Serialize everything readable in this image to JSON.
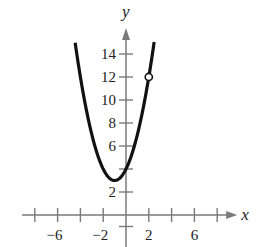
{
  "chart_data": {
    "type": "line",
    "title": "",
    "xlabel": "x",
    "ylabel": "y",
    "function": "y = x^2 + 2x + 4 (x < 2)",
    "xlim": [
      -8,
      8
    ],
    "ylim": [
      -1.5,
      15
    ],
    "x_ticks": [
      -8,
      -6,
      -4,
      -2,
      0,
      2,
      4,
      6,
      8
    ],
    "x_tick_labels": [
      {
        "value": -6,
        "label": "−6"
      },
      {
        "value": -2,
        "label": "−2"
      },
      {
        "value": 2,
        "label": "2"
      },
      {
        "value": 6,
        "label": "6"
      }
    ],
    "y_ticks": [
      -1,
      2,
      4,
      6,
      8,
      10,
      12,
      14
    ],
    "y_tick_labels": [
      {
        "value": 2,
        "label": "2"
      },
      {
        "value": 6,
        "label": "6"
      },
      {
        "value": 8,
        "label": "8"
      },
      {
        "value": 10,
        "label": "10"
      },
      {
        "value": 12,
        "label": "12"
      },
      {
        "value": 14,
        "label": "14"
      }
    ],
    "series": [
      {
        "name": "parabola",
        "vertex": [
          -1,
          3
        ],
        "y_intercept": [
          0,
          4
        ],
        "x_range": [
          -4.46,
          2
        ],
        "points": [
          [
            -4.46,
            15
          ],
          [
            -4,
            12
          ],
          [
            -3,
            7
          ],
          [
            -2,
            4
          ],
          [
            -1,
            3
          ],
          [
            0,
            4
          ],
          [
            1,
            7
          ],
          [
            2,
            12
          ]
        ]
      }
    ],
    "annotations": [
      {
        "type": "open-circle",
        "x": 2,
        "y": 12
      }
    ],
    "grid": false,
    "legend": null
  },
  "axes": {
    "x_label": "x",
    "y_label": "y"
  }
}
